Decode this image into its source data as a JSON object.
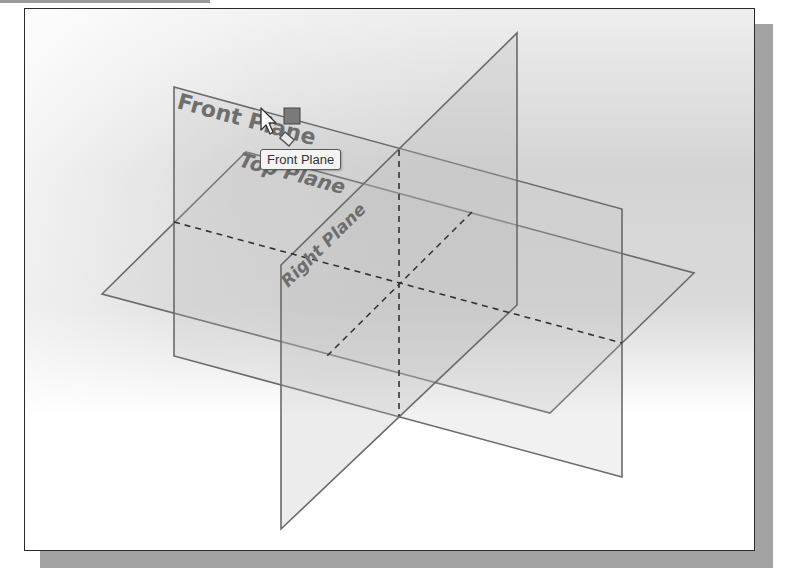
{
  "planes": {
    "front": {
      "label": "Front Plane"
    },
    "top": {
      "label": "Top Plane"
    },
    "right": {
      "label": "Right Plane"
    }
  },
  "tooltip": {
    "text": "Front Plane"
  },
  "colors": {
    "edge": "#6a6a6a",
    "label": "#6e6e6e",
    "frame": "#2a2a2a",
    "shadow": "#a3a3a3",
    "handle": "#777777"
  },
  "icons": {
    "cursor": "arrow-pointer",
    "handle": "square-handle",
    "plane_glyph": "plane-diamond"
  }
}
